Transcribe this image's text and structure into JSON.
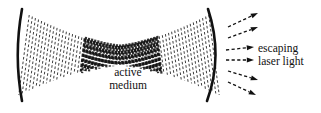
{
  "figure": {
    "kind": "laser-cavity-diagram",
    "background_color": "#ffffff",
    "ink_color": "#111111",
    "width": 321,
    "height": 113
  },
  "labels": {
    "active_medium_line1": "active",
    "active_medium_line2": "medium",
    "escaping_line1": "escaping",
    "escaping_line2": "laser light"
  },
  "components": {
    "left_mirror_name": "left concave mirror",
    "right_mirror_name": "right concave partially-transmitting mirror",
    "beam_name": "standing-wave laser beam",
    "waist_name": "active medium gain region",
    "escaping_arrows_name": "escaping laser light rays"
  },
  "geometry": {
    "left_mirror": {
      "top_x": 22,
      "top_y": 9,
      "bulge_x": 15,
      "mid_y": 56,
      "bottom_x": 22,
      "bottom_y": 101,
      "stroke": 2.6
    },
    "right_mirror": {
      "top_x": 208,
      "top_y": 9,
      "bulge_x": 222,
      "mid_y": 56,
      "bottom_x": 207,
      "bottom_y": 101,
      "stroke": 2.6
    },
    "beam": {
      "left_x": 24,
      "right_x": 214,
      "edge_half_height": 40,
      "waist_half_height": 9,
      "waist_x": 119,
      "columns": 58
    },
    "waist_dark": {
      "start_x": 80,
      "end_x": 160
    },
    "arrows": [
      {
        "x1": 228,
        "y1": 27,
        "x2": 258,
        "y2": 13
      },
      {
        "x1": 228,
        "y1": 38,
        "x2": 258,
        "y2": 27
      },
      {
        "x1": 226,
        "y1": 50,
        "x2": 254,
        "y2": 47
      },
      {
        "x1": 226,
        "y1": 60,
        "x2": 254,
        "y2": 60
      },
      {
        "x1": 228,
        "y1": 71,
        "x2": 258,
        "y2": 80
      },
      {
        "x1": 228,
        "y1": 82,
        "x2": 256,
        "y2": 95
      }
    ]
  },
  "chart_data": {
    "type": "diagram",
    "title": "",
    "annotations": [
      "active medium",
      "escaping laser light"
    ]
  }
}
